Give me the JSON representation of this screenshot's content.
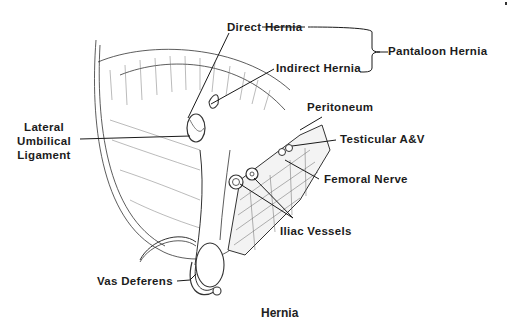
{
  "figure": {
    "caption": "Hernia",
    "labels": {
      "direct_hernia": "Direct Hernia",
      "indirect_hernia": "Indirect Hernia",
      "pantaloon_hernia": "Pantaloon Hernia",
      "lateral_umbilical_ligament": [
        "Lateral",
        "Umbilical",
        "Ligament"
      ],
      "peritoneum": "Peritoneum",
      "testicular_av": "Testicular A&V",
      "femoral_nerve": "Femoral Nerve",
      "iliac_vessels": "Iliac Vessels",
      "vas_deferens": "Vas Deferens"
    }
  }
}
